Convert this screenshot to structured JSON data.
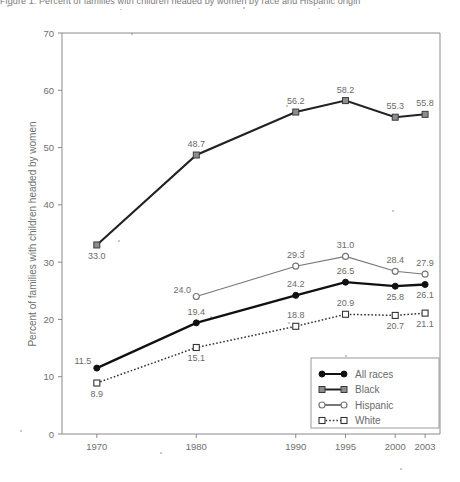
{
  "figure": {
    "top_caption_clipped": "Figure 1. Percent of families with children headed by women by race and Hispanic origin"
  },
  "chart_data": {
    "type": "line",
    "title": "",
    "xlabel": "",
    "ylabel": "Percent of families with children headed by women",
    "categories": [
      "1970",
      "1980",
      "1990",
      "1995",
      "2000",
      "2003"
    ],
    "x_positions": [
      1970,
      1980,
      1990,
      1995,
      2000,
      2003
    ],
    "xlim": [
      1966.5,
      2004.5
    ],
    "ylim": [
      0,
      70
    ],
    "yticks": [
      0,
      10,
      20,
      30,
      40,
      50,
      60,
      70
    ],
    "grid": false,
    "legend_position": "lower-right",
    "series": [
      {
        "name": "All races",
        "marker": "filled-circle",
        "line": "solid",
        "color": "#111111",
        "values": [
          11.5,
          19.4,
          24.2,
          26.5,
          25.8,
          26.1
        ],
        "labels": [
          "11.5",
          "19.4",
          "24.2",
          "26.5",
          "25.8",
          "26.1"
        ],
        "label_pos": [
          "left-above",
          "above",
          "above",
          "above",
          "below",
          "below"
        ]
      },
      {
        "name": "Black",
        "marker": "filled-square",
        "line": "solid",
        "color": "#222222",
        "values": [
          33.0,
          48.7,
          56.2,
          58.2,
          55.3,
          55.8
        ],
        "labels": [
          "33.0",
          "48.7",
          "56.2",
          "58.2",
          "55.3",
          "55.8"
        ],
        "label_pos": [
          "below",
          "above",
          "above",
          "above",
          "above",
          "above"
        ]
      },
      {
        "name": "Hispanic",
        "marker": "open-circle",
        "line": "solid",
        "color": "#777777",
        "values": [
          null,
          24.0,
          29.3,
          31.0,
          28.4,
          27.9
        ],
        "labels": [
          "",
          "24.0",
          "29.3",
          "31.0",
          "28.4",
          "27.9"
        ],
        "label_pos": [
          "",
          "left-above",
          "above",
          "above",
          "above",
          "above"
        ]
      },
      {
        "name": "White",
        "marker": "open-square",
        "line": "dotted",
        "color": "#333333",
        "values": [
          8.9,
          15.1,
          18.8,
          20.9,
          20.7,
          21.1
        ],
        "labels": [
          "8.9",
          "15.1",
          "18.8",
          "20.9",
          "20.7",
          "21.1"
        ],
        "label_pos": [
          "below",
          "below",
          "above",
          "above",
          "below",
          "below"
        ]
      }
    ]
  },
  "legend": {
    "items": [
      {
        "label": "All races"
      },
      {
        "label": "Black"
      },
      {
        "label": "Hispanic"
      },
      {
        "label": "White"
      }
    ]
  },
  "axis": {
    "y_tick_labels": [
      "0",
      "10",
      "20",
      "30",
      "40",
      "50",
      "60",
      "70"
    ],
    "x_tick_labels": [
      "1970",
      "1980",
      "1990",
      "1995",
      "2000",
      "2003"
    ]
  }
}
